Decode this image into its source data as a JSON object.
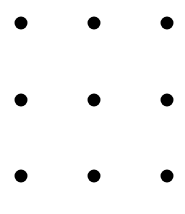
{
  "canvas": {
    "width": 185,
    "height": 214,
    "background_color": "#ffffff"
  },
  "figure": {
    "name": "three-by-three-dot-grid",
    "rows": 3,
    "columns": 3,
    "dot_color": "#000000",
    "dot_diameter": 13
  },
  "chart_data": {
    "type": "scatter",
    "title": "",
    "subtitle": "",
    "xlabel": "",
    "ylabel": "",
    "grid": false,
    "legend_position": "none",
    "axis_visible": false,
    "tick_labels_x": [],
    "tick_labels_y": [],
    "xlim": [
      0,
      185
    ],
    "ylim": [
      0,
      214
    ],
    "marker": "circle",
    "marker_size": 13,
    "marker_color": "#000000",
    "background_color": "#ffffff",
    "series": [
      {
        "name": "dots",
        "points": [
          {
            "label": "top-left",
            "x": 21,
            "y": 23
          },
          {
            "label": "top-center",
            "x": 94,
            "y": 23
          },
          {
            "label": "top-right",
            "x": 167,
            "y": 23
          },
          {
            "label": "middle-left",
            "x": 21,
            "y": 100
          },
          {
            "label": "middle-center",
            "x": 94,
            "y": 100
          },
          {
            "label": "middle-right",
            "x": 167,
            "y": 100
          },
          {
            "label": "bottom-left",
            "x": 21,
            "y": 176
          },
          {
            "label": "bottom-center",
            "x": 94,
            "y": 176
          },
          {
            "label": "bottom-right",
            "x": 167,
            "y": 176
          }
        ]
      }
    ],
    "annotations": []
  }
}
